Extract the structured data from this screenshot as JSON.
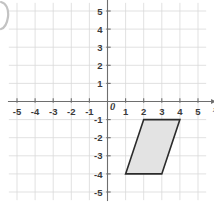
{
  "figure": {
    "title": "",
    "background_color": "#ffffff",
    "corner_artifact": {
      "name": "page-curl-artifact",
      "color": "#b8b8b8"
    }
  },
  "chart_data": {
    "type": "scatter",
    "title": "",
    "xlabel": "x",
    "ylabel": "",
    "xlim": [
      -5.5,
      5.5
    ],
    "ylim": [
      -5.5,
      5.5
    ],
    "grid": true,
    "grid_color": "#d9d9d9",
    "axis_color": "#6e6e6e",
    "x_ticks": [
      -5,
      -4,
      -3,
      -2,
      -1,
      0,
      1,
      2,
      3,
      4,
      5
    ],
    "y_ticks": [
      5,
      4,
      3,
      2,
      1,
      0,
      -1,
      -2,
      -3,
      -4,
      -5
    ],
    "x_tick_labels": [
      "-5",
      "-4",
      "-3",
      "-2",
      "-1",
      "0",
      "1",
      "2",
      "3",
      "4",
      "5"
    ],
    "y_tick_labels": [
      "5",
      "4",
      "3",
      "2",
      "1",
      "0",
      "-1",
      "-2",
      "-3",
      "-4",
      "-5"
    ],
    "origin_label": "0",
    "x_axis_arrow": true,
    "shapes": [
      {
        "name": "parallelogram",
        "kind": "polygon",
        "vertices": [
          [
            1,
            -4
          ],
          [
            2,
            -1
          ],
          [
            4,
            -1
          ],
          [
            3,
            -4
          ]
        ],
        "fill": "#e3e3e3",
        "stroke": "#2b2b2b",
        "stroke_width": 1.6
      }
    ]
  }
}
